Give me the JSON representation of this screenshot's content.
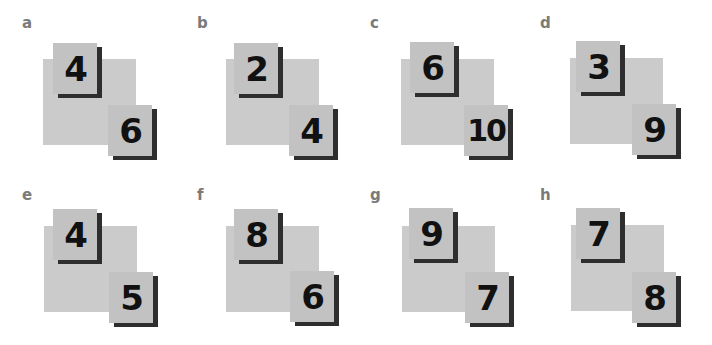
{
  "colors": {
    "base_square": "#cbcbcb",
    "card": "#c2c2c2",
    "card_shadow": "#2e2e2e",
    "label": "#7a7a7a",
    "digit": "#111111"
  },
  "panels": [
    {
      "label": "a",
      "top_card": "4",
      "bottom_card": "6"
    },
    {
      "label": "b",
      "top_card": "2",
      "bottom_card": "4"
    },
    {
      "label": "c",
      "top_card": "6",
      "bottom_card": "10"
    },
    {
      "label": "d",
      "top_card": "3",
      "bottom_card": "9"
    },
    {
      "label": "e",
      "top_card": "4",
      "bottom_card": "5"
    },
    {
      "label": "f",
      "top_card": "8",
      "bottom_card": "6"
    },
    {
      "label": "g",
      "top_card": "9",
      "bottom_card": "7"
    },
    {
      "label": "h",
      "top_card": "7",
      "bottom_card": "8"
    }
  ]
}
